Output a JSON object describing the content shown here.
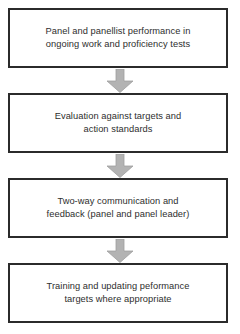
{
  "diagram": {
    "type": "vertical-flowchart",
    "orientation": "top-to-bottom",
    "box_border_color": "#2b2b2b",
    "box_fill_color": "#ffffff",
    "text_color": "#2e2e2e",
    "arrow_color": "#b3b3b3",
    "arrow_edge_color": "#9a9a9a",
    "background_color": "#ffffff",
    "steps": [
      {
        "id": "step-1",
        "label": "Panel and panellist performance in\nongoing work and proficiency tests"
      },
      {
        "id": "step-2",
        "label": "Evaluation against targets and\naction standards"
      },
      {
        "id": "step-3",
        "label": "Two-way communication and\nfeedback (panel and panel leader)"
      },
      {
        "id": "step-4",
        "label": "Training and updating peformance\ntargets where appropriate"
      }
    ],
    "connectors": [
      {
        "id": "arrow-1",
        "from": "step-1",
        "to": "step-2",
        "icon": "down-arrow-icon"
      },
      {
        "id": "arrow-2",
        "from": "step-2",
        "to": "step-3",
        "icon": "down-arrow-icon"
      },
      {
        "id": "arrow-3",
        "from": "step-3",
        "to": "step-4",
        "icon": "down-arrow-icon"
      }
    ]
  }
}
